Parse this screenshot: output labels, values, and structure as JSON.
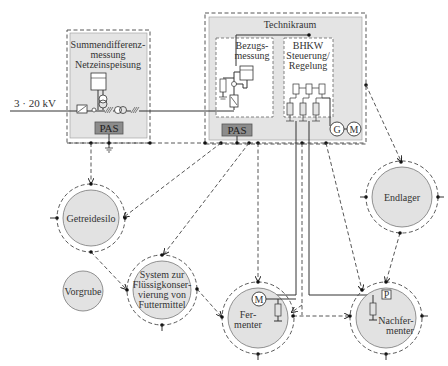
{
  "diagram": {
    "voltage_label": "3 · 20 kV",
    "blocks": {
      "summendifferenz": {
        "line1": "Summendifferenz-",
        "line2": "messung",
        "line3": "Netzeinspeisung",
        "pas": "PAS"
      },
      "technikraum": {
        "title": "Technikraum",
        "pas": "PAS",
        "bezugsmessung": {
          "line1": "Bezugs-",
          "line2": "messung"
        },
        "bhkw": {
          "line1": "BHKW",
          "line2": "Steuerung/",
          "line3": "Regelung"
        },
        "generator": "G",
        "motor": "M"
      }
    },
    "nodes": {
      "getreidesilo": "Getreidesilo",
      "vorgrube": "Vorgrube",
      "system": {
        "line1": "System zur",
        "line2": "Flüssigkonser-",
        "line3": "vierung von",
        "line4": "Futtermittel"
      },
      "fermenter": {
        "line1": "Fer-",
        "line2": "menter",
        "motor": "M"
      },
      "nachfermenter": {
        "line1": "Nachfer-",
        "line2": "menter",
        "sensor": "P"
      },
      "endlager": "Endlager"
    },
    "colors": {
      "box_fill": "#e4e4e4",
      "circle_fill": "#e2e2e2",
      "pas_fill": "#8c8c8c",
      "line": "#333333"
    }
  }
}
